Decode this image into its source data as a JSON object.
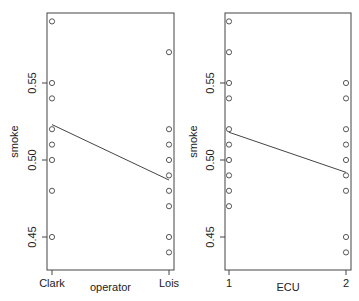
{
  "chart_data": [
    {
      "type": "scatter",
      "panel": "left",
      "title": "",
      "xlabel": "operator",
      "ylabel": "smoke",
      "categories": [
        "Clark",
        "Lois"
      ],
      "ylim": [
        0.43,
        0.6
      ],
      "yticks": [
        "0.45",
        "0.50",
        "0.55"
      ],
      "grid": false,
      "points": [
        {
          "x": "Clark",
          "y": 0.59
        },
        {
          "x": "Clark",
          "y": 0.55
        },
        {
          "x": "Clark",
          "y": 0.54
        },
        {
          "x": "Clark",
          "y": 0.52
        },
        {
          "x": "Clark",
          "y": 0.51
        },
        {
          "x": "Clark",
          "y": 0.5
        },
        {
          "x": "Clark",
          "y": 0.48
        },
        {
          "x": "Clark",
          "y": 0.45
        },
        {
          "x": "Lois",
          "y": 0.57
        },
        {
          "x": "Lois",
          "y": 0.52
        },
        {
          "x": "Lois",
          "y": 0.51
        },
        {
          "x": "Lois",
          "y": 0.5
        },
        {
          "x": "Lois",
          "y": 0.49
        },
        {
          "x": "Lois",
          "y": 0.48
        },
        {
          "x": "Lois",
          "y": 0.47
        },
        {
          "x": "Lois",
          "y": 0.45
        },
        {
          "x": "Lois",
          "y": 0.44
        }
      ],
      "fit_line": {
        "from": {
          "x": "Clark",
          "y": 0.523
        },
        "to": {
          "x": "Lois",
          "y": 0.487
        }
      }
    },
    {
      "type": "scatter",
      "panel": "right",
      "title": "",
      "xlabel": "ECU",
      "ylabel": "smoke",
      "categories": [
        "1",
        "2"
      ],
      "ylim": [
        0.43,
        0.6
      ],
      "yticks": [
        "0.45",
        "0.50",
        "0.55"
      ],
      "grid": false,
      "points": [
        {
          "x": "1",
          "y": 0.59
        },
        {
          "x": "1",
          "y": 0.57
        },
        {
          "x": "1",
          "y": 0.55
        },
        {
          "x": "1",
          "y": 0.54
        },
        {
          "x": "1",
          "y": 0.52
        },
        {
          "x": "1",
          "y": 0.51
        },
        {
          "x": "1",
          "y": 0.5
        },
        {
          "x": "1",
          "y": 0.49
        },
        {
          "x": "1",
          "y": 0.48
        },
        {
          "x": "1",
          "y": 0.47
        },
        {
          "x": "2",
          "y": 0.55
        },
        {
          "x": "2",
          "y": 0.54
        },
        {
          "x": "2",
          "y": 0.52
        },
        {
          "x": "2",
          "y": 0.51
        },
        {
          "x": "2",
          "y": 0.5
        },
        {
          "x": "2",
          "y": 0.49
        },
        {
          "x": "2",
          "y": 0.48
        },
        {
          "x": "2",
          "y": 0.45
        },
        {
          "x": "2",
          "y": 0.44
        }
      ],
      "fit_line": {
        "from": {
          "x": "1",
          "y": 0.518
        },
        "to": {
          "x": "2",
          "y": 0.492
        }
      }
    }
  ],
  "colors": {
    "axis": "#444444",
    "point": "#444444",
    "line": "#444444",
    "background": "#ffffff"
  }
}
